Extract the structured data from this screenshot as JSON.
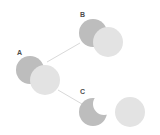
{
  "figure": {
    "type": "set-relation-diagram",
    "background_color": "#ffffff",
    "width": 160,
    "height": 135,
    "colors": {
      "dark_circle": "#bdbdbd",
      "light_circle": "#e3e3e3",
      "connector_line": "#d9d9d9",
      "label_text": "#4d4d4d",
      "notch_fill": "#ffffff"
    },
    "labels": {
      "a": "A",
      "b": "B",
      "c": "C"
    },
    "groups": [
      {
        "id": "a",
        "label": "A",
        "relation": "partial-overlap",
        "label_x": 17,
        "label_y": 49,
        "circles": [
          {
            "name": "dark",
            "cx": 30,
            "cy": 70,
            "r": 14,
            "fill": "#bdbdbd"
          },
          {
            "name": "light",
            "cx": 45,
            "cy": 80,
            "r": 15,
            "fill": "#e3e3e3"
          }
        ]
      },
      {
        "id": "b",
        "label": "B",
        "relation": "partial-overlap",
        "label_x": 80,
        "label_y": 11,
        "circles": [
          {
            "name": "dark",
            "cx": 93,
            "cy": 33,
            "r": 14,
            "fill": "#bdbdbd"
          },
          {
            "name": "light",
            "cx": 108,
            "cy": 42,
            "r": 15,
            "fill": "#e3e3e3"
          }
        ]
      },
      {
        "id": "c",
        "label": "C",
        "relation": "disjoint-with-notch",
        "label_x": 80,
        "label_y": 88,
        "circles": [
          {
            "name": "dark-notched",
            "cx": 93,
            "cy": 112,
            "r": 14,
            "fill": "#bdbdbd"
          },
          {
            "name": "notch",
            "cx": 104,
            "cy": 104,
            "r": 11,
            "fill": "#ffffff"
          },
          {
            "name": "light",
            "cx": 130,
            "cy": 112,
            "r": 15,
            "fill": "#e3e3e3"
          }
        ]
      }
    ],
    "connectors": [
      {
        "id": "a-to-b",
        "from": "a",
        "to": "b",
        "x1": 47,
        "y1": 62,
        "x2": 80,
        "y2": 43
      },
      {
        "id": "a-to-c",
        "from": "a",
        "to": "c",
        "x1": 58,
        "y1": 90,
        "x2": 82,
        "y2": 104
      }
    ]
  }
}
